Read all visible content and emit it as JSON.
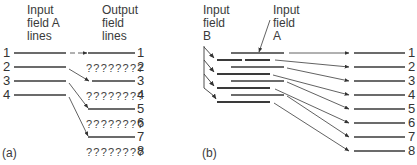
{
  "panel_a": {
    "caption": "(a)",
    "input_header": [
      "Input",
      "field A",
      "lines"
    ],
    "output_header": [
      "Output",
      "field",
      "lines"
    ],
    "input_lines": [
      "1",
      "2",
      "3",
      "4"
    ],
    "output_lines": [
      {
        "num": "1",
        "filler": ""
      },
      {
        "num": "2",
        "filler": "????????"
      },
      {
        "num": "3",
        "filler": ""
      },
      {
        "num": "4",
        "filler": "????????"
      },
      {
        "num": "5",
        "filler": ""
      },
      {
        "num": "6",
        "filler": "????????"
      },
      {
        "num": "7",
        "filler": ""
      },
      {
        "num": "8",
        "filler": "????????"
      }
    ]
  },
  "panel_b": {
    "caption": "(b)",
    "input_b_header": [
      "Input",
      "field",
      "B"
    ],
    "input_a_header": [
      "Input",
      "field",
      "A"
    ],
    "output_lines": [
      "1",
      "2",
      "3",
      "4",
      "5",
      "6",
      "7",
      "8"
    ]
  },
  "colors": {
    "line": "#3a3a3a",
    "text": "#333333",
    "background": "#ffffff"
  }
}
